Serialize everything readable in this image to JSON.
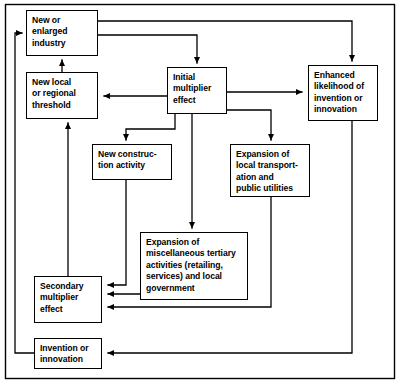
{
  "diagram": {
    "type": "flowchart",
    "frame": {
      "stroke": "#000000",
      "fill": "#ffffff"
    },
    "nodes": [
      {
        "id": "new-or-enlarged-industry",
        "label": "New or\nenlarged\nindustry",
        "x": 26,
        "y": 10,
        "w": 72,
        "h": 46
      },
      {
        "id": "new-local-or-regional-threshold",
        "label": "New local\nor regional\nthreshold",
        "x": 26,
        "y": 72,
        "w": 72,
        "h": 47
      },
      {
        "id": "initial-multiplier-effect",
        "label": "Initial\nmultiplier\neffect",
        "x": 167,
        "y": 67,
        "w": 60,
        "h": 47
      },
      {
        "id": "enhanced-likelihood-of-invention-or-innovation",
        "label": "Enhanced\nlikelihood of\ninvention or\ninnovation",
        "x": 308,
        "y": 65,
        "w": 70,
        "h": 56
      },
      {
        "id": "new-construction-activity",
        "label": "New construc-\ntion activity",
        "x": 92,
        "y": 144,
        "w": 80,
        "h": 36
      },
      {
        "id": "expansion-of-local-transportation-and-public-utilities",
        "label": "Expansion of\nlocal transport-\nation and\npublic utilities",
        "x": 230,
        "y": 144,
        "w": 80,
        "h": 53
      },
      {
        "id": "expansion-of-miscellaneous-tertiary-activities",
        "label": "Expansion of\nmiscellaneous tertiary\nactivities (retailing,\nservices) and local\ngovernment",
        "x": 140,
        "y": 232,
        "w": 108,
        "h": 68
      },
      {
        "id": "secondary-multiplier-effect",
        "label": "Secondary\nmultiplier\neffect",
        "x": 34,
        "y": 276,
        "w": 68,
        "h": 47
      },
      {
        "id": "invention-or-innovation",
        "label": "Invention or\ninnovation",
        "x": 34,
        "y": 338,
        "w": 68,
        "h": 31
      }
    ],
    "edges": [
      {
        "id": "industry-to-enhanced-likelihood",
        "from": "new-or-enlarged-industry",
        "to": "enhanced-likelihood-of-invention-or-innovation"
      },
      {
        "id": "industry-to-initial-multiplier",
        "from": "new-or-enlarged-industry",
        "to": "initial-multiplier-effect"
      },
      {
        "id": "initial-multiplier-to-threshold",
        "from": "initial-multiplier-effect",
        "to": "new-local-or-regional-threshold"
      },
      {
        "id": "initial-multiplier-to-enhanced-likelihood",
        "from": "initial-multiplier-effect",
        "to": "enhanced-likelihood-of-invention-or-innovation"
      },
      {
        "id": "initial-multiplier-to-new-construction",
        "from": "initial-multiplier-effect",
        "to": "new-construction-activity"
      },
      {
        "id": "initial-multiplier-to-transportation",
        "from": "initial-multiplier-effect",
        "to": "expansion-of-local-transportation-and-public-utilities"
      },
      {
        "id": "initial-multiplier-to-tertiary",
        "from": "initial-multiplier-effect",
        "to": "expansion-of-miscellaneous-tertiary-activities"
      },
      {
        "id": "new-construction-to-secondary-multiplier",
        "from": "new-construction-activity",
        "to": "secondary-multiplier-effect"
      },
      {
        "id": "tertiary-to-secondary-multiplier",
        "from": "expansion-of-miscellaneous-tertiary-activities",
        "to": "secondary-multiplier-effect"
      },
      {
        "id": "transportation-to-secondary-multiplier",
        "from": "expansion-of-local-transportation-and-public-utilities",
        "to": "secondary-multiplier-effect"
      },
      {
        "id": "secondary-multiplier-to-threshold",
        "from": "secondary-multiplier-effect",
        "to": "new-local-or-regional-threshold"
      },
      {
        "id": "threshold-to-industry",
        "from": "new-local-or-regional-threshold",
        "to": "new-or-enlarged-industry"
      },
      {
        "id": "enhanced-likelihood-to-invention",
        "from": "enhanced-likelihood-of-invention-or-innovation",
        "to": "invention-or-innovation"
      },
      {
        "id": "invention-to-industry",
        "from": "invention-or-innovation",
        "to": "new-or-enlarged-industry"
      }
    ]
  }
}
